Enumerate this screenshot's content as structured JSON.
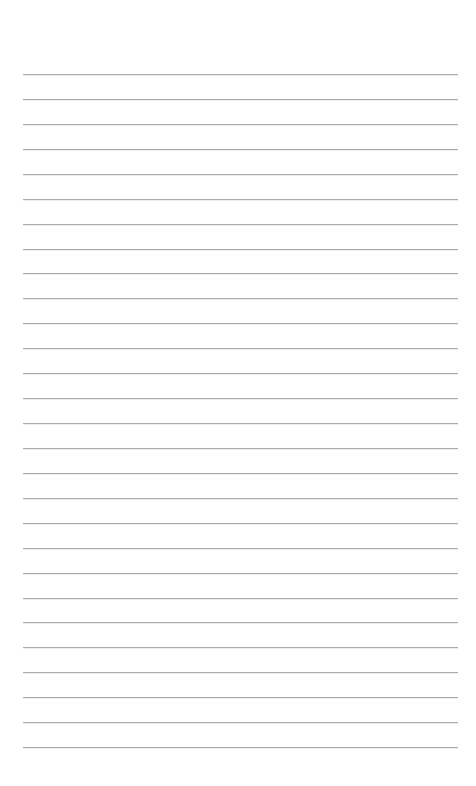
{
  "page": {
    "type": "lined-paper",
    "background_color": "#ffffff",
    "line_color": "#ababab",
    "line_count": 28,
    "first_line_y": 74,
    "line_spacing": 24.93,
    "line_left": 23,
    "line_right": 458
  }
}
